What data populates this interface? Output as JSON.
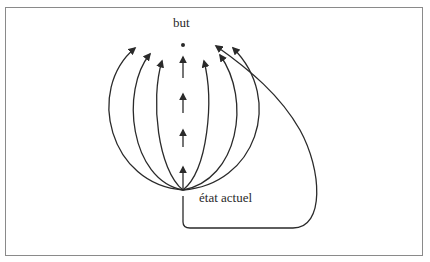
{
  "diagram": {
    "type": "flow-diagram",
    "labels": {
      "goal": "but",
      "current_state": "état actuel"
    },
    "nodes": [
      {
        "id": "goal",
        "label": "but",
        "x": 183,
        "y": 45
      },
      {
        "id": "current_state",
        "label": "état actuel",
        "x": 183,
        "y": 190
      }
    ],
    "paths": [
      {
        "id": "direct-dashed",
        "style": "dashed-arrows",
        "from": "current_state",
        "to": "goal",
        "arrow_count": 4
      },
      {
        "id": "arc-left-1",
        "from": "current_state",
        "side": "left"
      },
      {
        "id": "arc-left-2",
        "from": "current_state",
        "side": "left"
      },
      {
        "id": "arc-left-3",
        "from": "current_state",
        "side": "left"
      },
      {
        "id": "arc-right-1",
        "from": "current_state",
        "side": "right"
      },
      {
        "id": "arc-right-2",
        "from": "current_state",
        "side": "right"
      },
      {
        "id": "arc-right-3",
        "from": "current_state",
        "side": "right"
      },
      {
        "id": "detour-loop",
        "from": "current_state",
        "side": "below-right",
        "note": "goes down, right, then up to goal"
      }
    ],
    "colors": {
      "stroke": "#2a2a2a",
      "border": "#8a8a8a",
      "background": "#ffffff"
    }
  }
}
